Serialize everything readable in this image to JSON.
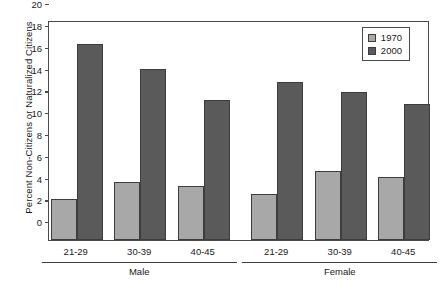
{
  "chart_data": {
    "type": "bar",
    "title": "",
    "xlabel": "",
    "ylabel": "Percent Non-Citizens or Naturalized Citizens",
    "ylim": [
      0,
      20
    ],
    "yticks": [
      0,
      2,
      4,
      6,
      8,
      10,
      12,
      14,
      16,
      18,
      20
    ],
    "grid": false,
    "legend_position": "top-right",
    "categories": [
      "21-29",
      "30-39",
      "40-45",
      "21-29",
      "30-39",
      "40-45"
    ],
    "group_labels": [
      "Male",
      "Female"
    ],
    "groups": [
      {
        "label": "Male",
        "categories": [
          "21-29",
          "30-39",
          "40-45"
        ]
      },
      {
        "label": "Female",
        "categories": [
          "21-29",
          "30-39",
          "40-45"
        ]
      }
    ],
    "series": [
      {
        "name": "1970",
        "color": "#a8a8a8",
        "values": [
          3.8,
          5.3,
          5.0,
          4.2,
          6.3,
          5.8
        ]
      },
      {
        "name": "2000",
        "color": "#5a5a5a",
        "values": [
          18.0,
          15.7,
          12.8,
          14.5,
          13.6,
          12.5
        ]
      }
    ]
  },
  "legend": {
    "items": [
      {
        "label": "1970",
        "color": "#a8a8a8"
      },
      {
        "label": "2000",
        "color": "#5a5a5a"
      }
    ]
  },
  "axes": {
    "y_title": "Percent Non-Citizens or Naturalized Citizens",
    "y_tick_labels": [
      "20",
      "18",
      "16",
      "14",
      "12",
      "10",
      "8",
      "6",
      "4",
      "2",
      "0"
    ]
  }
}
